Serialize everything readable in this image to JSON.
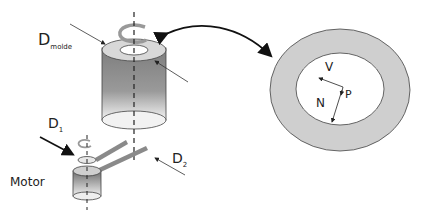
{
  "diagram": {
    "labels": {
      "d_molde_main": "D",
      "d_molde_sub": "molde",
      "d1_main": "D",
      "d1_sub": "1",
      "d2_main": "D",
      "d2_sub": "2",
      "motor": "Motor",
      "v": "V",
      "p": "P",
      "n": "N"
    },
    "colors": {
      "ring_fill": "#cfcfcf",
      "cylinder_dark": "#7a7a7a",
      "cylinder_light": "#f2f2f2",
      "stroke": "#333333",
      "belt": "#8a8a8a"
    }
  }
}
